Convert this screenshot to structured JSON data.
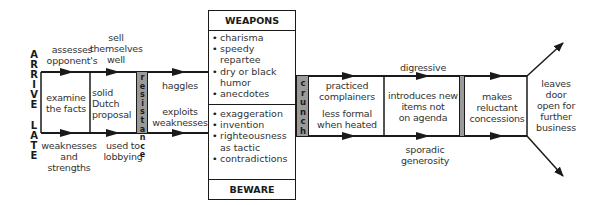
{
  "side_label": {
    "top_word": "ARRIVE",
    "bottom_word": "LATE",
    "top_letters": [
      "A",
      "R",
      "R",
      "I",
      "V",
      "E"
    ],
    "bottom_letters": [
      "L",
      "A",
      "T",
      "E"
    ]
  },
  "above_band": {
    "assesses": [
      "assesses",
      "opponent's"
    ],
    "sell": [
      "sell",
      "themselves",
      "well"
    ],
    "digressive": "digressive"
  },
  "below_band": {
    "weaknesses": [
      "weaknesses",
      "and strengths"
    ],
    "used": [
      "used to",
      "lobbying"
    ],
    "sporadic": [
      "sporadic",
      "generosity"
    ]
  },
  "stages": {
    "examine": [
      "examine",
      "the facts"
    ],
    "solid": [
      "solid",
      "Dutch",
      "proposal"
    ],
    "resistance": [
      "r",
      "e",
      "s",
      "i",
      "s",
      "t",
      "a",
      "n",
      "c",
      "e"
    ],
    "haggles": "haggles",
    "exploits": [
      "exploits",
      "weaknesses"
    ],
    "crunch": [
      "c",
      "r",
      "u",
      "n",
      "c",
      "h"
    ],
    "practiced": [
      "practiced",
      "complainers"
    ],
    "less_formal": [
      "less formal",
      "when heated"
    ],
    "introduces": [
      "introduces new",
      "items not",
      "on agenda"
    ],
    "makes": [
      "makes",
      "reluctant",
      "concessions"
    ],
    "leaves": [
      "leaves",
      "door",
      "open for",
      "further",
      "business"
    ]
  },
  "weapons_box": {
    "weapons_title": "WEAPONS",
    "weapons_items": [
      "charisma",
      "speedy repartee",
      "dry or black humor",
      "anecdotes"
    ],
    "beware_title": "BEWARE",
    "beware_items": [
      "exaggeration",
      "invention",
      "righteousness as tactic",
      "contradictions"
    ]
  },
  "colors": {
    "line": "#1a1a1a",
    "shaded_bar": "#9a9a9a",
    "text": "#333333"
  }
}
